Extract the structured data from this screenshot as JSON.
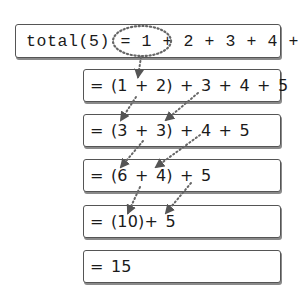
{
  "diagram": {
    "title_expression": "total(5) = 1 + 2 + 3 + 4 + 5",
    "steps": [
      {
        "id": "step-0",
        "text": "total(5) = 1 + 2 + 3 + 4 + 5",
        "font": "monospace"
      },
      {
        "id": "step-1",
        "text": "= (1 + 2) + 3 + 4 + 5"
      },
      {
        "id": "step-2",
        "text": "= (3 + 3) + 4 + 5"
      },
      {
        "id": "step-3",
        "text": "= (6 + 4) + 5"
      },
      {
        "id": "step-4",
        "text": "= (10)+ 5"
      },
      {
        "id": "step-5",
        "text": "= 15"
      }
    ],
    "highlight": {
      "shape": "dotted-ellipse",
      "encloses": "1 + 2",
      "in_step": 0
    },
    "arrows": [
      {
        "from_step": 0,
        "to_step": 1,
        "meaning": "1 + 2 grouped"
      },
      {
        "from_step": 1,
        "to_step": 2,
        "meaning": "(1 + 2) -> 3"
      },
      {
        "from_step": 1,
        "to_step": 2,
        "meaning": "3 -> 3"
      },
      {
        "from_step": 2,
        "to_step": 3,
        "meaning": "(3 + 3) -> 6"
      },
      {
        "from_step": 2,
        "to_step": 3,
        "meaning": "4 -> 4"
      },
      {
        "from_step": 3,
        "to_step": 4,
        "meaning": "(6 + 4) -> 10"
      },
      {
        "from_step": 3,
        "to_step": 4,
        "meaning": "5 -> 5"
      }
    ],
    "colors": {
      "box_border": "#555555",
      "box_shadow": "#8a8a8a",
      "text": "#1a1a1a",
      "dotted_line": "#666666"
    }
  }
}
